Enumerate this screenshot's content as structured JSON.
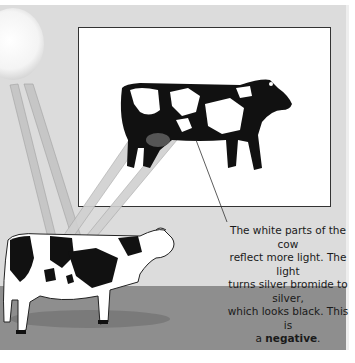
{
  "illustration": {
    "title": "How a negative is made",
    "elements": [
      "sun-icon",
      "light-rays",
      "real-cow",
      "negative-cow-image",
      "photo-frame",
      "ground"
    ],
    "colors": {
      "background": "#dcdcdc",
      "frame": "#ffffff",
      "ground": "#8e8e8e",
      "text": "#1a1a1a"
    }
  },
  "caption": {
    "line1": "The white parts of the cow",
    "line2": "reflect more light. The light",
    "line3": "turns silver bromide to silver,",
    "line4": "which looks black. This is",
    "line5_prefix": "a ",
    "line5_bold": "negative",
    "line5_suffix": "."
  }
}
